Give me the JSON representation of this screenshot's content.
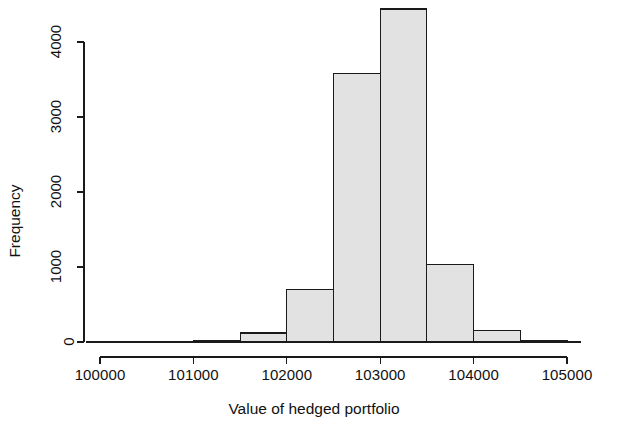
{
  "chart_data": {
    "type": "bar",
    "subtype": "histogram",
    "title": "",
    "xlabel": "Value of hedged portfolio",
    "ylabel": "Frequency",
    "xlim": [
      99800,
      105300
    ],
    "ylim": [
      0,
      4500
    ],
    "xticks": [
      100000,
      101000,
      102000,
      103000,
      104000,
      105000
    ],
    "xtick_labels": [
      "100000",
      "101000",
      "102000",
      "103000",
      "104000",
      "105000"
    ],
    "yticks": [
      0,
      1000,
      2000,
      3000,
      4000
    ],
    "ytick_labels": [
      "0",
      "1000",
      "2000",
      "3000",
      "4000"
    ],
    "grid": false,
    "legend": null,
    "bin_width": 500,
    "bins": [
      {
        "left": 100000,
        "right": 100500,
        "value": 0
      },
      {
        "left": 100500,
        "right": 101000,
        "value": 0
      },
      {
        "left": 101000,
        "right": 101500,
        "value": 20
      },
      {
        "left": 101500,
        "right": 102000,
        "value": 120
      },
      {
        "left": 102000,
        "right": 102500,
        "value": 700
      },
      {
        "left": 102500,
        "right": 103000,
        "value": 3580
      },
      {
        "left": 103000,
        "right": 103500,
        "value": 4440
      },
      {
        "left": 103500,
        "right": 104000,
        "value": 1030
      },
      {
        "left": 104000,
        "right": 104500,
        "value": 150
      },
      {
        "left": 104500,
        "right": 105000,
        "value": 20
      }
    ],
    "categories": [
      "100000-100500",
      "100500-101000",
      "101000-101500",
      "101500-102000",
      "102000-102500",
      "102500-103000",
      "103000-103500",
      "103500-104000",
      "104000-104500",
      "104500-105000"
    ],
    "values": [
      0,
      0,
      20,
      120,
      700,
      3580,
      4440,
      1030,
      150,
      20
    ],
    "colors": {
      "bar_fill": "#e2e2e2",
      "bar_stroke": "#1a1a1a",
      "axis": "#1a1a1a",
      "background": "#ffffff",
      "text": "#111111"
    }
  }
}
